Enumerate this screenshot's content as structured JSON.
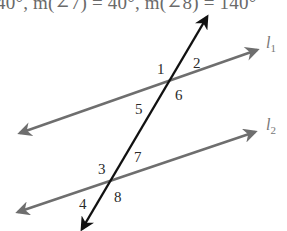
{
  "header": {
    "text": "40°, m(∠7) = 40°, m(∠8) = 140°"
  },
  "diagram": {
    "colors": {
      "transversal": "#111111",
      "parallel_lines": "#6e6e6e",
      "labels": "#2a2a2a",
      "line_labels": "#777777"
    },
    "lines": {
      "l1": {
        "name": "l",
        "subscript": "1"
      },
      "l2": {
        "name": "l",
        "subscript": "2"
      }
    },
    "angle_labels": [
      "1",
      "2",
      "3",
      "4",
      "5",
      "6",
      "7",
      "8"
    ]
  }
}
